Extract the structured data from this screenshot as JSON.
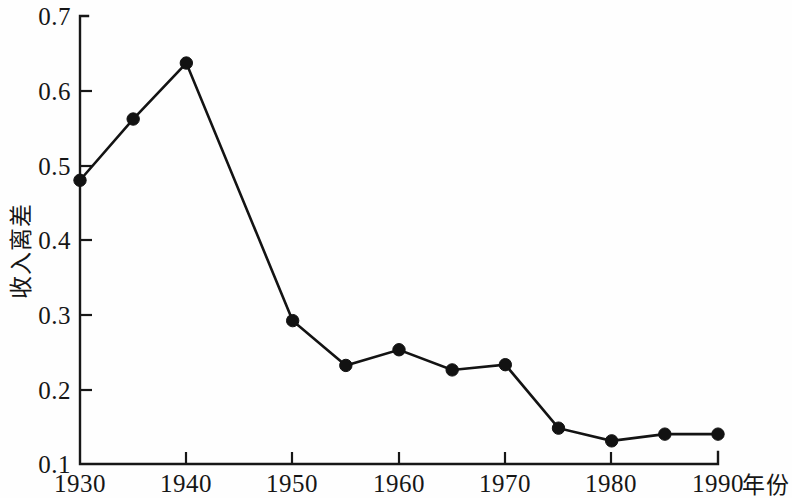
{
  "chart_data": {
    "type": "line",
    "title": "",
    "subtitle": "",
    "xlabel": "年份",
    "ylabel": "收入离差",
    "x": [
      1930,
      1935,
      1940,
      1950,
      1955,
      1960,
      1965,
      1970,
      1975,
      1980,
      1985,
      1990
    ],
    "values": [
      0.48,
      0.562,
      0.637,
      0.292,
      0.232,
      0.253,
      0.226,
      0.233,
      0.148,
      0.131,
      0.14,
      0.14
    ],
    "series": [
      {
        "name": "收入离差",
        "values": [
          0.48,
          0.562,
          0.637,
          0.292,
          0.232,
          0.253,
          0.226,
          0.233,
          0.148,
          0.131,
          0.14,
          0.14
        ]
      }
    ],
    "xlim": [
      1930,
      1990
    ],
    "ylim": [
      0.1,
      0.7
    ],
    "xticks": [
      1930,
      1940,
      1950,
      1960,
      1970,
      1980,
      1990
    ],
    "xticklabels": [
      "1930",
      "1940",
      "1950",
      "1960",
      "1970",
      "1980",
      "1990"
    ],
    "yticks": [
      0.1,
      0.2,
      0.3,
      0.4,
      0.5,
      0.6,
      0.7
    ],
    "yticklabels": [
      "0.1",
      "0.2",
      "0.3",
      "0.4",
      "0.5",
      "0.6",
      "0.7"
    ],
    "grid": false,
    "legend": null,
    "legend_position": "none",
    "marker": "filled-circle",
    "line_color": "#131313",
    "marker_color": "#121212",
    "background_color": "#fefefe",
    "annotations": []
  },
  "axes": {
    "y_title": "收入离差",
    "x_title": "年份",
    "y_tick_labels": [
      "0.7",
      "0.6",
      "0.5",
      "0.4",
      "0.3",
      "0.2",
      "0.1"
    ],
    "x_tick_labels": [
      "1930",
      "1940",
      "1950",
      "1960",
      "1970",
      "1980",
      "1990"
    ]
  }
}
